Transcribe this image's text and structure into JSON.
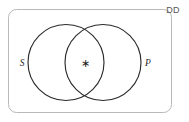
{
  "figure": {
    "title_label": "DD",
    "background_color": "#ffffff",
    "box": {
      "name": "universal-set-box",
      "stroke_color": "#b9b9b9",
      "x": 8,
      "y": 9,
      "width": 164,
      "height": 104,
      "corner_radius": 8
    },
    "circles": [
      {
        "label": "S",
        "name": "set-circle-s",
        "cx": 66,
        "cy": 62.5,
        "r": 38,
        "stroke_color": "#2b2b2b",
        "label_x": 22,
        "label_y": 66
      },
      {
        "label": "P",
        "name": "set-circle-p",
        "cx": 103,
        "cy": 62.5,
        "r": 38,
        "stroke_color": "#2b2b2b",
        "label_x": 146,
        "label_y": 66
      }
    ],
    "marks": [
      {
        "name": "intersection-element-mark",
        "symbol": "∗",
        "x": 84.5,
        "y": 66,
        "region": "S ∩ P"
      }
    ]
  }
}
